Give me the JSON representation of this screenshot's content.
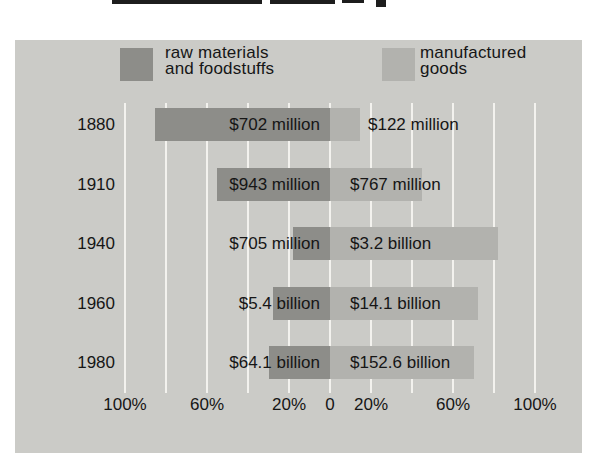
{
  "chart_data": {
    "type": "bar",
    "orientation": "horizontal-diverging",
    "categories": [
      "1880",
      "1910",
      "1940",
      "1960",
      "1980"
    ],
    "series": [
      {
        "name": "raw materials and foodstuffs",
        "side": "left",
        "labels": [
          "$702 million",
          "$943 million",
          "$705 million",
          "$5.4 billion",
          "$64.1 billion"
        ],
        "values_millions": [
          702,
          943,
          705,
          5400,
          64100
        ]
      },
      {
        "name": "manufactured goods",
        "side": "right",
        "labels": [
          "$122 million",
          "$767 million",
          "$3.2 billion",
          "$14.1 billion",
          "$152.6 billion"
        ],
        "values_millions": [
          122,
          767,
          3200,
          14100,
          152600
        ]
      }
    ],
    "share_of_total_pct": {
      "raw_materials": [
        85.2,
        55.1,
        18.1,
        27.7,
        29.6
      ],
      "manufactured": [
        14.8,
        44.9,
        81.9,
        72.3,
        70.4
      ]
    },
    "axis_ticks": [
      "100%",
      "60%",
      "20%",
      "0",
      "20%",
      "60%",
      "100%"
    ],
    "axis_tick_pcts": [
      -100,
      -60,
      -20,
      0,
      20,
      60,
      100
    ],
    "gridline_pcts": [
      -100,
      -80,
      -60,
      -40,
      -20,
      0,
      20,
      40,
      60,
      80,
      100
    ],
    "grid": true,
    "legend_position": "top",
    "legend": {
      "raw_line1": "raw materials",
      "raw_line2": "and foodstuffs",
      "mfg_line1": "manufactured",
      "mfg_line2": "goods"
    },
    "colors": {
      "panel": "#cbcbc7",
      "raw_materials": "#8d8d89",
      "manufactured": "#b2b2ae",
      "gridline": "#f3f2ee",
      "text": "#161616"
    }
  }
}
